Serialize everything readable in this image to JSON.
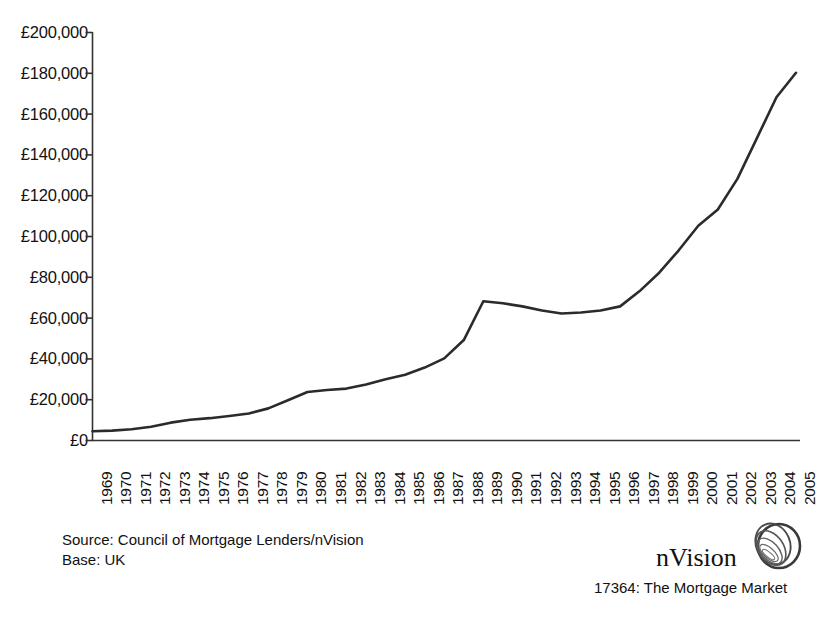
{
  "chart_data": {
    "type": "line",
    "title": "",
    "xlabel": "",
    "ylabel": "",
    "ylim": [
      0,
      200000
    ],
    "ytick_values": [
      0,
      20000,
      40000,
      60000,
      80000,
      100000,
      120000,
      140000,
      160000,
      180000,
      200000
    ],
    "ytick_labels": [
      "£0",
      "£20,000",
      "£40,000",
      "£60,000",
      "£80,000",
      "£100,000",
      "£120,000",
      "£140,000",
      "£160,000",
      "£180,000",
      "£200,000"
    ],
    "grid": false,
    "legend": "none",
    "series_color": "#2b2b2b",
    "categories": [
      "1969",
      "1970",
      "1971",
      "1972",
      "1973",
      "1974",
      "1975",
      "1976",
      "1977",
      "1978",
      "1979",
      "1980",
      "1981",
      "1982",
      "1983",
      "1984",
      "1985",
      "1986",
      "1987",
      "1988",
      "1989",
      "1990",
      "1991",
      "1992",
      "1993",
      "1994",
      "1995",
      "1996",
      "1997",
      "1998",
      "1999",
      "2000",
      "2001",
      "2002",
      "2003",
      "2004",
      "2005"
    ],
    "series": [
      {
        "name": "Average house price",
        "values": [
          4300,
          4600,
          5300,
          6500,
          8500,
          9900,
          10700,
          11800,
          13000,
          15500,
          19500,
          23500,
          24500,
          25200,
          27200,
          29800,
          32000,
          35500,
          40000,
          49000,
          68000,
          67000,
          65500,
          63500,
          62000,
          62500,
          63500,
          65500,
          73000,
          82000,
          93000,
          105000,
          113000,
          128000,
          148000,
          168000,
          180000
        ]
      }
    ]
  },
  "axis": {
    "y_label_prefix": "£"
  },
  "footer": {
    "source": "Source: Council of Mortgage Lenders/nVision",
    "base": "Base: UK",
    "caption": "17364: The Mortgage Market",
    "brand": "nVision"
  }
}
